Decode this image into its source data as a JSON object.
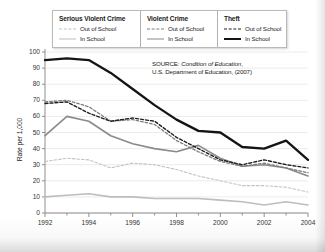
{
  "legend": {
    "columns": [
      {
        "title": "Serious Violent Crime",
        "out_label": "Out of School",
        "in_label": "In School"
      },
      {
        "title": "Violent Crime",
        "out_label": "Out of School",
        "in_label": "In School"
      },
      {
        "title": "Theft",
        "out_label": "Out of School",
        "in_label": "In School"
      }
    ]
  },
  "source": {
    "prefix": "SOURCE:",
    "italic": "Condition of Education",
    "rest": ",",
    "line2": "U.S. Department of Education,  (2007)"
  },
  "colors": {
    "serious_violent_out": "#c3c3c3",
    "serious_violent_in": "#bdbdbd",
    "violent_out": "#7d7d7d",
    "violent_in": "#8a8a8a",
    "theft_out": "#1f1f1f",
    "theft_in": "#141414",
    "grid": "#e3e3e3",
    "axis": "#8f8f8f"
  },
  "chart_data": {
    "type": "line",
    "title": "",
    "xlabel": "",
    "ylabel": "Rate per 1,000",
    "ylim": [
      0,
      100
    ],
    "ytick_values": [
      0,
      10,
      20,
      30,
      40,
      50,
      60,
      70,
      80,
      90,
      100
    ],
    "xlim": [
      1992,
      2004
    ],
    "x": [
      1992,
      1993,
      1994,
      1995,
      1996,
      1997,
      1998,
      1999,
      2000,
      2001,
      2002,
      2003,
      2004
    ],
    "xtick_labels": [
      "1992",
      "1994",
      "1996",
      "1998",
      "2000",
      "2002",
      "2004"
    ],
    "xtick_values": [
      1992,
      1994,
      1996,
      1998,
      2000,
      2002,
      2004
    ],
    "grid": true,
    "legend_position": "top",
    "series": [
      {
        "name": "Theft — In School",
        "key": "theft_in",
        "style": "solid",
        "color": "#141414",
        "width": 2.3,
        "values": [
          95,
          96,
          95,
          87,
          77,
          67,
          58,
          51,
          50,
          41,
          40,
          45,
          33
        ]
      },
      {
        "name": "Theft — Out of School",
        "key": "theft_out",
        "style": "dashed",
        "color": "#1f1f1f",
        "width": 1.4,
        "values": [
          68,
          69,
          62,
          57,
          59,
          57,
          47,
          40,
          33,
          30,
          33,
          30,
          28
        ]
      },
      {
        "name": "Violent Crime — Out of School",
        "key": "violent_out",
        "style": "dashed",
        "color": "#7d7d7d",
        "width": 1.3,
        "values": [
          69,
          70,
          66,
          57,
          58,
          55,
          45,
          38,
          32,
          29,
          31,
          28,
          25
        ]
      },
      {
        "name": "Violent Crime — In School",
        "key": "violent_in",
        "style": "solid",
        "color": "#8a8a8a",
        "width": 1.6,
        "values": [
          48,
          60,
          57,
          48,
          43,
          40,
          38,
          42,
          34,
          29,
          30,
          28,
          23
        ]
      },
      {
        "name": "Serious Violent Crime — Out of School",
        "key": "serious_violent_out",
        "style": "dashed",
        "color": "#c3c3c3",
        "width": 1.1,
        "values": [
          32,
          34,
          33,
          28,
          31,
          30,
          27,
          23,
          20,
          17,
          17,
          16,
          13
        ]
      },
      {
        "name": "Serious Violent Crime — In School",
        "key": "serious_violent_in",
        "style": "solid",
        "color": "#bdbdbd",
        "width": 1.6,
        "values": [
          10,
          11,
          12,
          10,
          10,
          9,
          9,
          9,
          8,
          7,
          5,
          7,
          5
        ]
      }
    ]
  }
}
